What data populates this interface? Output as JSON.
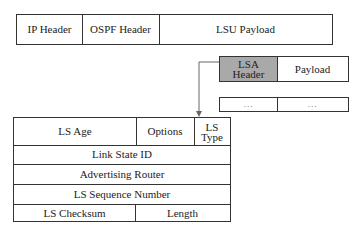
{
  "packet": {
    "fields": [
      "IP Header",
      "OSPF Header",
      "LSU Payload"
    ]
  },
  "lsa": {
    "header_label_line1": "LSA",
    "header_label_line2": "Header",
    "payload_label": "Payload",
    "header_fill_color": "#a9a9a9",
    "more_row": [
      "...",
      "..."
    ]
  },
  "lsa_header_format": {
    "row1": {
      "ls_age": "LS Age",
      "options": "Options",
      "ls_type_line1": "LS",
      "ls_type_line2": "Type"
    },
    "row2": "Link State ID",
    "row3": "Advertising Router",
    "row4": "LS Sequence Number",
    "row5": {
      "checksum": "LS Checksum",
      "length": "Length"
    }
  }
}
